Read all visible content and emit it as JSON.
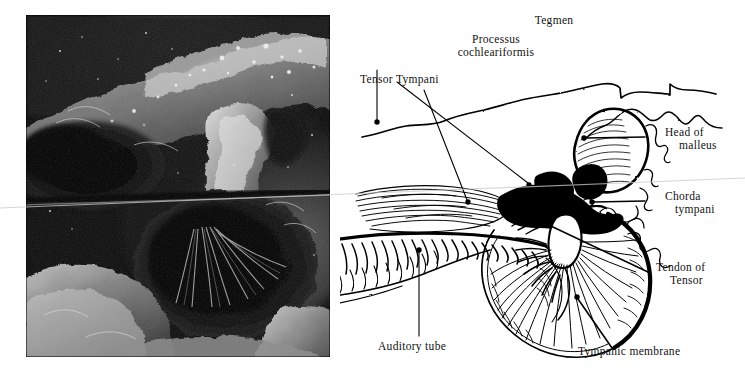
{
  "figure": {
    "kind": "anatomical-figure",
    "background_color": "#ffffff",
    "ink_color": "#000000",
    "panels": [
      {
        "id": "photograph",
        "type": "grayscale-photograph",
        "description": "temporal bone dissection photograph"
      },
      {
        "id": "line-drawing",
        "type": "labelled-line-drawing",
        "description": "middle ear / tympanic membrane key drawing"
      }
    ]
  },
  "photo": {
    "alt": "Grayscale dissection photograph of the middle ear cavity",
    "border_color": "#000000"
  },
  "labels": {
    "tegmen": "Tegmen",
    "processus_line1": "Processus",
    "processus_line2": "cochleariformis",
    "tensor_tympani": "Tensor Tympani",
    "head_of_line1": "Head of",
    "head_of_line2": "malleus",
    "chorda_line1": "Chorda",
    "chorda_line2": "tympani",
    "tendon_line1": "Tendon of",
    "tendon_line2": "Tensor",
    "auditory_tube": "Auditory tube",
    "tympanic_membrane": "Tympanic membrane"
  },
  "leaders": {
    "tegmen": {
      "from": [
        377,
        70
      ],
      "to": [
        377,
        122
      ],
      "dot": [
        377,
        122
      ]
    },
    "processus": {
      "from": [
        397,
        82
      ],
      "to": [
        528,
        185
      ],
      "dot": [
        528,
        185
      ]
    },
    "tensor_tympani": {
      "from": [
        424,
        90
      ],
      "to": [
        468,
        202
      ],
      "dot": [
        468,
        202
      ]
    },
    "head_of_malleus": {
      "from": [
        645,
        133
      ],
      "to": [
        583,
        138
      ],
      "dot": [
        583,
        138
      ]
    },
    "chorda_tympani": {
      "from": [
        645,
        198
      ],
      "to": [
        592,
        202
      ],
      "dot": [
        592,
        202
      ]
    },
    "tendon_of_tensor": {
      "from": [
        648,
        270
      ],
      "to": [
        535,
        216
      ],
      "dot": [
        535,
        216
      ]
    },
    "auditory_tube": {
      "from": [
        419,
        335
      ],
      "to": [
        419,
        250
      ],
      "dot": [
        419,
        250
      ]
    },
    "tympanic_membrane": {
      "from": [
        612,
        346
      ],
      "to": [
        577,
        297
      ],
      "dot": [
        577,
        297
      ]
    }
  }
}
